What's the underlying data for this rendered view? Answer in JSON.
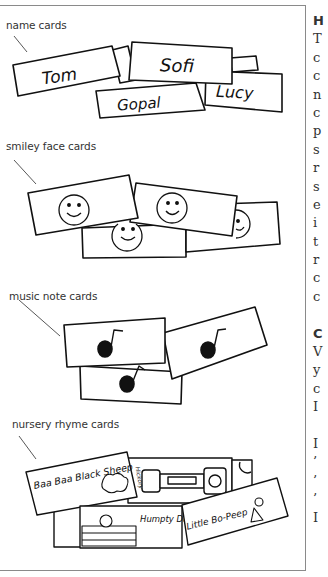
{
  "page": {
    "sections": [
      {
        "label": "name cards",
        "cards": [
          "Tom",
          "Sofi",
          "Gopal",
          "Lucy"
        ]
      },
      {
        "label": "smiley face cards",
        "cards": [
          "smiley",
          "smiley",
          "smiley",
          "smiley"
        ]
      },
      {
        "label": "music note cards",
        "cards": [
          "music-note",
          "music-note",
          "music-note"
        ]
      },
      {
        "label": "nursery rhyme cards",
        "cards": [
          "Baa Baa Black Sheep",
          "Hickory",
          "Humpty Dumpty",
          "Little Bo-Peep"
        ]
      }
    ]
  },
  "side_column": {
    "lines": [
      "H",
      "T",
      "c",
      "c",
      "n",
      "c",
      "p",
      "s",
      "r",
      "s",
      "e",
      "i",
      "t",
      "r",
      "c",
      "c",
      "",
      "C",
      "V",
      "y",
      "c",
      "I",
      "",
      "I",
      "’",
      "’",
      "’",
      "I"
    ]
  }
}
